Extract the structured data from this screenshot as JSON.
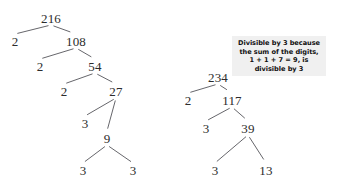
{
  "figure": {
    "ink_color": "#2c2c2c",
    "line_color": "#55555a",
    "annotation_background": "#f0f0f0",
    "background": "#ffffff"
  },
  "trees": [
    {
      "name": "factor-tree-216",
      "root_value": "216",
      "nodes": [
        {
          "id": "t1-216",
          "label": "216",
          "x": 51,
          "y": 18
        },
        {
          "id": "t1-2a",
          "label": "2",
          "x": 15,
          "y": 41
        },
        {
          "id": "t1-108",
          "label": "108",
          "x": 76,
          "y": 41
        },
        {
          "id": "t1-2b",
          "label": "2",
          "x": 40,
          "y": 66
        },
        {
          "id": "t1-54",
          "label": "54",
          "x": 95,
          "y": 66
        },
        {
          "id": "t1-2c",
          "label": "2",
          "x": 64,
          "y": 91
        },
        {
          "id": "t1-27",
          "label": "27",
          "x": 116,
          "y": 91
        },
        {
          "id": "t1-3a",
          "label": "3",
          "x": 85,
          "y": 123
        },
        {
          "id": "t1-9",
          "label": "9",
          "x": 107,
          "y": 138
        },
        {
          "id": "t1-3b",
          "label": "3",
          "x": 83,
          "y": 170
        },
        {
          "id": "t1-3c",
          "label": "3",
          "x": 133,
          "y": 170
        }
      ],
      "edges": [
        {
          "from": "t1-216",
          "to": "t1-2a"
        },
        {
          "from": "t1-216",
          "to": "t1-108"
        },
        {
          "from": "t1-108",
          "to": "t1-2b"
        },
        {
          "from": "t1-108",
          "to": "t1-54"
        },
        {
          "from": "t1-54",
          "to": "t1-2c"
        },
        {
          "from": "t1-54",
          "to": "t1-27"
        },
        {
          "from": "t1-27",
          "to": "t1-3a"
        },
        {
          "from": "t1-27",
          "to": "t1-9"
        },
        {
          "from": "t1-9",
          "to": "t1-3b"
        },
        {
          "from": "t1-9",
          "to": "t1-3c"
        }
      ]
    },
    {
      "name": "factor-tree-234",
      "root_value": "234",
      "nodes": [
        {
          "id": "t2-234",
          "label": "234",
          "x": 218,
          "y": 77
        },
        {
          "id": "t2-2",
          "label": "2",
          "x": 188,
          "y": 100
        },
        {
          "id": "t2-117",
          "label": "117",
          "x": 232,
          "y": 100
        },
        {
          "id": "t2-3a",
          "label": "3",
          "x": 206,
          "y": 128
        },
        {
          "id": "t2-39",
          "label": "39",
          "x": 248,
          "y": 128
        },
        {
          "id": "t2-3b",
          "label": "3",
          "x": 215,
          "y": 170
        },
        {
          "id": "t2-13",
          "label": "13",
          "x": 266,
          "y": 170
        }
      ],
      "edges": [
        {
          "from": "t2-234",
          "to": "t2-2"
        },
        {
          "from": "t2-234",
          "to": "t2-117"
        },
        {
          "from": "t2-117",
          "to": "t2-3a"
        },
        {
          "from": "t2-117",
          "to": "t2-39"
        },
        {
          "from": "t2-39",
          "to": "t2-3b"
        },
        {
          "from": "t2-39",
          "to": "t2-13"
        }
      ]
    }
  ],
  "annotation": {
    "name": "divisibility-note",
    "lines": [
      "Divisible by 3 because",
      "the sum of the digits,",
      "1 + 1 + 7 = 9, is",
      "divisible by 3"
    ],
    "box": {
      "x": 232,
      "y": 36,
      "width": 94,
      "height": 40
    }
  }
}
